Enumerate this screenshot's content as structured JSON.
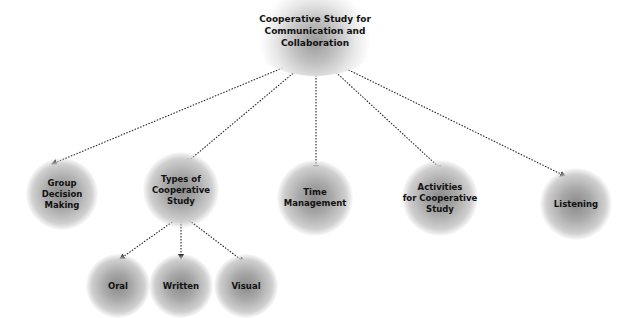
{
  "diagram": {
    "type": "concept-map",
    "root": {
      "id": "root",
      "label": "Cooperative Study for\nCommunication and\nCollaboration",
      "x": 315,
      "y": 28
    },
    "nodes": [
      {
        "id": "group",
        "label": "Group\nDecision\nMaking",
        "x": 62,
        "y": 192,
        "parent": "root"
      },
      {
        "id": "types",
        "label": "Types of\nCooperative\nStudy",
        "x": 181,
        "y": 188,
        "parent": "root"
      },
      {
        "id": "time",
        "label": "Time\nManagement",
        "x": 315,
        "y": 196,
        "parent": "root"
      },
      {
        "id": "activities",
        "label": "Activities\nfor Cooperative\nStudy",
        "x": 440,
        "y": 196,
        "parent": "root"
      },
      {
        "id": "listening",
        "label": "Listening",
        "x": 576,
        "y": 204,
        "parent": "root"
      },
      {
        "id": "oral",
        "label": "Oral",
        "x": 118,
        "y": 285,
        "parent": "types"
      },
      {
        "id": "written",
        "label": "Written",
        "x": 181,
        "y": 286,
        "parent": "types"
      },
      {
        "id": "visual",
        "label": "Visual",
        "x": 246,
        "y": 286,
        "parent": "types"
      }
    ],
    "edges": [
      {
        "from": [
          316,
          54
        ],
        "to": [
          52,
          164
        ]
      },
      {
        "from": [
          316,
          54
        ],
        "to": [
          186,
          163
        ]
      },
      {
        "from": [
          316,
          54
        ],
        "to": [
          316,
          170
        ]
      },
      {
        "from": [
          316,
          54
        ],
        "to": [
          442,
          170
        ]
      },
      {
        "from": [
          316,
          54
        ],
        "to": [
          565,
          176
        ]
      },
      {
        "from": [
          182,
          215
        ],
        "to": [
          120,
          259
        ]
      },
      {
        "from": [
          181,
          215
        ],
        "to": [
          181,
          259
        ]
      },
      {
        "from": [
          182,
          215
        ],
        "to": [
          244,
          262
        ]
      }
    ],
    "style": {
      "edge_color": "#222222",
      "edge_dash": "1.5,1.5",
      "node_shade": "#8a8a8a",
      "text_color": "#111111"
    }
  }
}
